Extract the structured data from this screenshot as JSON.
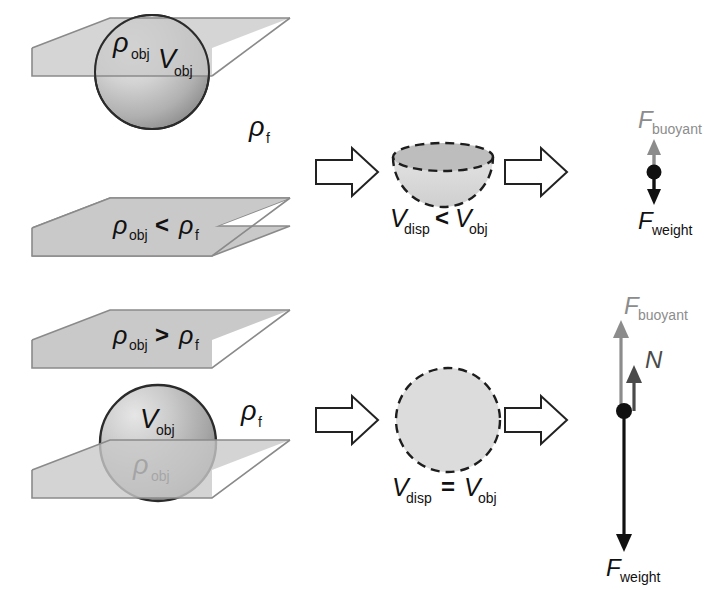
{
  "figure": {
    "colors": {
      "plane_fill": "#c9c9c9",
      "plane_stroke": "#8a8a8a",
      "sphere_light": "#e8e8e8",
      "sphere_mid": "#c2c2c2",
      "sphere_dark": "#9a9a9a",
      "dashed_fill": "#dcdcdc",
      "hemisphere_top_fill": "#bdbdbd",
      "arrow_outline_stroke": "#222222",
      "arrow_outline_fill": "#ffffff",
      "force_buoyant": "#8c8c8c",
      "force_normal": "#4a4a4a",
      "force_weight": "#111111",
      "dot": "#111111",
      "text": "#111111"
    }
  },
  "scene_float": {
    "name": "floating-object-scene",
    "sphere_labels": {
      "density": "ρ",
      "density_sub": "obj",
      "volume": "V",
      "volume_sub": "obj"
    },
    "fluid_label": {
      "symbol": "ρ",
      "sub": "f"
    },
    "condition": {
      "left_symbol": "ρ",
      "left_sub": "obj",
      "operator": "<",
      "right_symbol": "ρ",
      "right_sub": "f"
    },
    "displaced": {
      "symbol": "V",
      "sub": "disp",
      "operator": "<",
      "right_symbol": "V",
      "right_sub": "obj"
    },
    "forces": [
      {
        "name": "F-buoyant",
        "label": "F",
        "sub": "buoyant",
        "direction": "up",
        "color": "#8c8c8c"
      },
      {
        "name": "F-weight",
        "label": "F",
        "sub": "weight",
        "direction": "down",
        "color": "#111111"
      }
    ]
  },
  "scene_sink": {
    "name": "sinking-object-scene",
    "condition": {
      "left_symbol": "ρ",
      "left_sub": "obj",
      "operator": ">",
      "right_symbol": "ρ",
      "right_sub": "f"
    },
    "sphere_labels": {
      "volume": "V",
      "volume_sub": "obj",
      "density": "ρ",
      "density_sub": "obj"
    },
    "fluid_label": {
      "symbol": "ρ",
      "sub": "f"
    },
    "displaced": {
      "symbol": "V",
      "sub": "disp",
      "operator": "=",
      "right_symbol": "V",
      "right_sub": "obj"
    },
    "forces": [
      {
        "name": "F-buoyant",
        "label": "F",
        "sub": "buoyant",
        "direction": "up",
        "color": "#8c8c8c"
      },
      {
        "name": "N-normal",
        "label": "N",
        "sub": "",
        "direction": "up",
        "color": "#4a4a4a"
      },
      {
        "name": "F-weight",
        "label": "F",
        "sub": "weight",
        "direction": "down",
        "color": "#111111"
      }
    ]
  },
  "arrows": {
    "block_arrow_name": "block-arrow-right",
    "count": 4
  }
}
